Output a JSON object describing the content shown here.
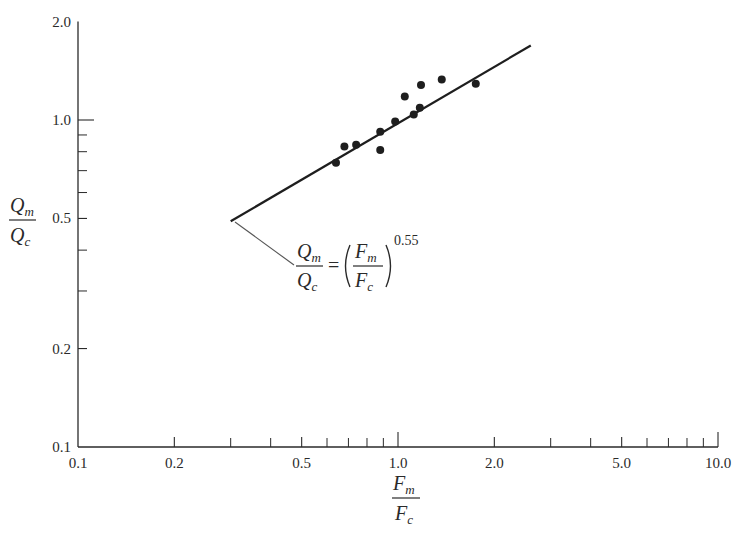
{
  "chart_data": {
    "type": "scatter",
    "title": "",
    "xscale": "log",
    "yscale": "log",
    "xlabel": "F_m / F_c",
    "ylabel": "Q_m / Q_c",
    "xlim": [
      0.1,
      10.0
    ],
    "ylim": [
      0.1,
      2.0
    ],
    "x_tick_labels": [
      "0.1",
      "0.2",
      "0.5",
      "1.0",
      "2.0",
      "5.0",
      "10.0"
    ],
    "x_tick_values": [
      0.1,
      0.2,
      0.5,
      1.0,
      2.0,
      5.0,
      10.0
    ],
    "x_minor_ticks": [
      0.3,
      0.4,
      0.6,
      0.7,
      0.8,
      0.9,
      3,
      4,
      6,
      7,
      8,
      9
    ],
    "y_tick_labels": [
      "0.1",
      "0.2",
      "0.5",
      "1.0",
      "2.0"
    ],
    "y_tick_values": [
      0.1,
      0.2,
      0.5,
      1.0,
      2.0
    ],
    "y_minor_ticks": [
      0.3,
      0.4,
      0.6,
      0.7,
      0.8,
      0.9
    ],
    "grid": false,
    "legend": null,
    "series": [
      {
        "name": "observations",
        "kind": "scatter",
        "points": [
          {
            "x": 0.64,
            "y": 0.74
          },
          {
            "x": 0.68,
            "y": 0.83
          },
          {
            "x": 0.74,
            "y": 0.84
          },
          {
            "x": 0.88,
            "y": 0.81
          },
          {
            "x": 0.88,
            "y": 0.92
          },
          {
            "x": 0.98,
            "y": 0.99
          },
          {
            "x": 1.05,
            "y": 1.18
          },
          {
            "x": 1.12,
            "y": 1.04
          },
          {
            "x": 1.17,
            "y": 1.09
          },
          {
            "x": 1.18,
            "y": 1.28
          },
          {
            "x": 1.37,
            "y": 1.33
          },
          {
            "x": 1.75,
            "y": 1.29
          }
        ]
      },
      {
        "name": "fit",
        "kind": "line",
        "equation": "Q_m/Q_c = (F_m/F_c)^0.55",
        "exponent": 0.55,
        "x_range": [
          0.3,
          2.6
        ],
        "points": [
          {
            "x": 0.3,
            "y": 0.49
          },
          {
            "x": 2.6,
            "y": 1.69
          }
        ]
      }
    ],
    "annotations": [
      {
        "text": "Q_m/Q_c = (F_m/F_c)^0.55",
        "points_to": {
          "x": 0.3,
          "y": 0.49
        }
      }
    ]
  },
  "labels": {
    "y_num": "Q",
    "y_num_sub": "m",
    "y_den": "Q",
    "y_den_sub": "c",
    "x_num": "F",
    "x_num_sub": "m",
    "x_den": "F",
    "x_den_sub": "c",
    "eq_lhs_num": "Q",
    "eq_lhs_num_sub": "m",
    "eq_lhs_den": "Q",
    "eq_lhs_den_sub": "c",
    "eq_equals": "=",
    "eq_rhs_num": "F",
    "eq_rhs_num_sub": "m",
    "eq_rhs_den": "F",
    "eq_rhs_den_sub": "c",
    "eq_exponent": "0.55"
  },
  "colors": {
    "ink": "#2a2a2a",
    "background": "#ffffff"
  }
}
